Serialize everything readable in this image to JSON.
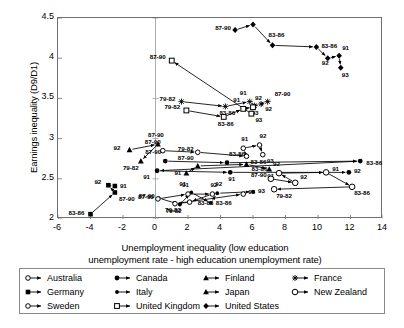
{
  "chart_data": {
    "type": "scatter",
    "title": "",
    "xlabel": "Unemployment inequality (low education unemployment rate - high education unemployment rate)",
    "xlabel_line1": "Unemployment inequality (low education",
    "xlabel_line2": "unemployment rate - high education unemployment rate)",
    "ylabel": "Earnings inequality (D9/D1)",
    "xlim": [
      -6,
      14
    ],
    "ylim": [
      2,
      4.5
    ],
    "xticks": [
      -6,
      -4,
      -2,
      0,
      2,
      4,
      6,
      8,
      10,
      12,
      14
    ],
    "xtick_labels": [
      "-6",
      "-4",
      "-2",
      "0",
      "2",
      "4",
      "6",
      "8",
      "10",
      "12",
      "14"
    ],
    "yticks": [
      2,
      2.5,
      3,
      3.5,
      4,
      4.5
    ],
    "ytick_labels": [
      "2",
      "2.5",
      "3",
      "3.5",
      "4",
      "4.5"
    ],
    "grid": false,
    "legend_position": "below-plot",
    "point_labels": [
      "79-82",
      "83-86",
      "87-90",
      "91",
      "92",
      "93"
    ],
    "series": [
      {
        "name": "Australia",
        "marker": "open-circle",
        "points": [
          {
            "label": "87-90",
            "x": 0.45,
            "y": 2.85,
            "lx": -18,
            "ly": -7
          },
          {
            "label": "79-82",
            "x": 2.6,
            "y": 2.83,
            "lx": -20,
            "ly": -1
          },
          {
            "label": "83-86",
            "x": 5.6,
            "y": 2.78,
            "lx": 4,
            "ly": 8
          },
          {
            "label": "91",
            "x": 5.4,
            "y": 2.88,
            "lx": -2,
            "ly": -7
          },
          {
            "label": "92",
            "x": 6.4,
            "y": 2.92,
            "lx": 0,
            "ly": -7
          },
          {
            "label": "93",
            "x": 6.6,
            "y": 2.8,
            "lx": 4,
            "ly": 8
          }
        ]
      },
      {
        "name": "Canada",
        "marker": "filled-circle",
        "points": [
          {
            "label": "87-90",
            "x": 0.6,
            "y": 2.72,
            "lx": -20,
            "ly": -7
          },
          {
            "label": "83-86",
            "x": 4.4,
            "y": 2.7,
            "lx": 2,
            "ly": -7
          },
          {
            "label": "83-86",
            "x": 12.6,
            "y": 2.72,
            "lx": 6,
            "ly": 4
          },
          {
            "label": "91",
            "x": 0.1,
            "y": 2.6,
            "lx": -14,
            "ly": 8
          },
          {
            "label": "91",
            "x": 4.6,
            "y": 2.58,
            "lx": -2,
            "ly": 9
          },
          {
            "label": "92",
            "x": 11.9,
            "y": 2.58,
            "lx": 5,
            "ly": 1
          }
        ]
      },
      {
        "name": "Finland",
        "marker": "filled-triangle",
        "points": [
          {
            "label": "92",
            "x": -1.6,
            "y": 2.86,
            "lx": -16,
            "ly": 0
          },
          {
            "label": "87-90",
            "x": 0.15,
            "y": 2.93,
            "lx": -10,
            "ly": -7
          },
          {
            "label": "79-82",
            "x": -0.9,
            "y": 2.72,
            "lx": -18,
            "ly": 9
          }
        ]
      },
      {
        "name": "France",
        "marker": "star-x",
        "points": [
          {
            "label": "79-82",
            "x": 1.6,
            "y": 3.46,
            "lx": -22,
            "ly": -1
          },
          {
            "label": "83-86",
            "x": 4.3,
            "y": 3.4,
            "lx": -6,
            "ly": 9
          },
          {
            "label": "91",
            "x": 5.8,
            "y": 3.46,
            "lx": -10,
            "ly": -7
          },
          {
            "label": "93",
            "x": 6.1,
            "y": 3.41,
            "lx": -3,
            "ly": 9
          },
          {
            "label": "92",
            "x": 6.5,
            "y": 3.43,
            "lx": 4,
            "ly": 7
          },
          {
            "label": "87-90",
            "x": 6.9,
            "y": 3.46,
            "lx": 7,
            "ly": -6
          }
        ]
      },
      {
        "name": "Germany",
        "marker": "filled-square",
        "points": [
          {
            "label": "83-86",
            "x": -4.0,
            "y": 2.06,
            "lx": -22,
            "ly": 1
          },
          {
            "label": "87-90",
            "x": -2.5,
            "y": 2.33,
            "lx": 4,
            "ly": 9
          },
          {
            "label": "92",
            "x": -2.9,
            "y": 2.42,
            "lx": -14,
            "ly": -1
          },
          {
            "label": "91",
            "x": -2.5,
            "y": 2.41,
            "lx": 5,
            "ly": 2
          }
        ]
      },
      {
        "name": "Italy",
        "marker": "filled-circle-sm",
        "points": [
          {
            "label": "87-90",
            "x": 0.2,
            "y": 2.26,
            "lx": -20,
            "ly": 0
          },
          {
            "label": "79-82",
            "x": 1.5,
            "y": 2.18,
            "lx": -14,
            "ly": 8
          },
          {
            "label": "91",
            "x": 2.2,
            "y": 2.33,
            "lx": -12,
            "ly": -6
          },
          {
            "label": "83-86",
            "x": 3.4,
            "y": 2.2,
            "lx": 5,
            "ly": 2
          },
          {
            "label": "92",
            "x": 3.8,
            "y": 2.32,
            "lx": -2,
            "ly": -7
          },
          {
            "label": "93",
            "x": 6.0,
            "y": 2.34,
            "lx": 5,
            "ly": 1
          }
        ]
      },
      {
        "name": "Japan",
        "marker": "filled-triangle-up",
        "points": [
          {
            "label": "91",
            "x": 1.9,
            "y": 2.57,
            "lx": -12,
            "ly": 2
          },
          {
            "label": "87-90",
            "x": 2.6,
            "y": 2.66,
            "lx": -20,
            "ly": -6
          },
          {
            "label": "83-86",
            "x": 5.6,
            "y": 2.68,
            "lx": 5,
            "ly": 7
          },
          {
            "label": "91",
            "x": 7.0,
            "y": 2.62,
            "lx": -2,
            "ly": 9
          }
        ]
      },
      {
        "name": "New Zealand",
        "marker": "open-circle-lg",
        "points": [
          {
            "label": "87-90",
            "x": 7.1,
            "y": 2.5,
            "lx": -20,
            "ly": -2
          },
          {
            "label": "92",
            "x": 8.6,
            "y": 2.45,
            "lx": 5,
            "ly": -4
          },
          {
            "label": "92",
            "x": 7.6,
            "y": 2.57,
            "lx": -6,
            "ly": -7
          },
          {
            "label": "91",
            "x": 10.5,
            "y": 2.58,
            "lx": 6,
            "ly": -1
          },
          {
            "label": "83-86",
            "x": 12.1,
            "y": 2.4,
            "lx": 2,
            "ly": 8
          },
          {
            "label": "79-82",
            "x": 7.3,
            "y": 2.37,
            "lx": 2,
            "ly": 9
          }
        ]
      },
      {
        "name": "Sweden",
        "marker": "open-circle",
        "points": [
          {
            "label": "87-90",
            "x": 0.15,
            "y": 2.25,
            "lx": -20,
            "ly": 0
          },
          {
            "label": "91",
            "x": 2.0,
            "y": 2.31,
            "lx": -6,
            "ly": -7
          },
          {
            "label": "92",
            "x": 3.5,
            "y": 2.31,
            "lx": -2,
            "ly": -7
          },
          {
            "label": "83-86",
            "x": 2.1,
            "y": 2.21,
            "lx": 8,
            "ly": 3
          },
          {
            "label": "79-82",
            "x": 1.2,
            "y": 2.19,
            "lx": -10,
            "ly": 8
          },
          {
            "label": "93",
            "x": 5.4,
            "y": 2.31,
            "lx": 5,
            "ly": 0
          }
        ]
      },
      {
        "name": "United Kingdom",
        "marker": "open-square",
        "points": [
          {
            "label": "79-82",
            "x": 1.9,
            "y": 3.35,
            "lx": -22,
            "ly": -1
          },
          {
            "label": "83-86",
            "x": 4.2,
            "y": 3.27,
            "lx": -6,
            "ly": 9
          },
          {
            "label": "91",
            "x": 5.4,
            "y": 3.37,
            "lx": -10,
            "ly": -7
          },
          {
            "label": "92",
            "x": 6.0,
            "y": 3.39,
            "lx": 2,
            "ly": -7
          },
          {
            "label": "93",
            "x": 5.9,
            "y": 3.31,
            "lx": 4,
            "ly": 8
          },
          {
            "label": "87-90",
            "x": 1.0,
            "y": 3.97,
            "lx": -22,
            "ly": -2
          }
        ]
      },
      {
        "name": "United States",
        "marker": "filled-diamond",
        "points": [
          {
            "label": "87-90",
            "x": 4.9,
            "y": 4.35,
            "lx": -20,
            "ly": 0
          },
          {
            "label": "91",
            "x": 6.0,
            "y": 4.42,
            "lx": 4,
            "ly": -6
          },
          {
            "label": "83-86",
            "x": 7.2,
            "y": 4.16,
            "lx": -4,
            "ly": -8
          },
          {
            "label": "83-86",
            "x": 9.9,
            "y": 4.14,
            "lx": 5,
            "ly": 1
          },
          {
            "label": "92",
            "x": 10.6,
            "y": 4.0,
            "lx": -6,
            "ly": 7
          },
          {
            "label": "91",
            "x": 11.3,
            "y": 4.03,
            "lx": 3,
            "ly": -6
          },
          {
            "label": "93",
            "x": 11.4,
            "y": 3.88,
            "lx": 1,
            "ly": 9
          }
        ]
      }
    ]
  },
  "legend": {
    "items": [
      {
        "label": "Australia",
        "marker": "open-circle"
      },
      {
        "label": "Canada",
        "marker": "filled-circle"
      },
      {
        "label": "Finland",
        "marker": "filled-triangle"
      },
      {
        "label": "France",
        "marker": "star-x"
      },
      {
        "label": "Germany",
        "marker": "filled-square"
      },
      {
        "label": "Italy",
        "marker": "filled-circle-sm"
      },
      {
        "label": "Japan",
        "marker": "filled-triangle-up"
      },
      {
        "label": "New Zealand",
        "marker": "open-circle-lg"
      },
      {
        "label": "Sweden",
        "marker": "open-circle"
      },
      {
        "label": "United Kingdom",
        "marker": "open-square"
      },
      {
        "label": "United States",
        "marker": "filled-diamond"
      }
    ]
  },
  "colors": {
    "line": "#000000",
    "frame": "#6f6f6f",
    "text": "#000000",
    "background": "#ffffff"
  }
}
